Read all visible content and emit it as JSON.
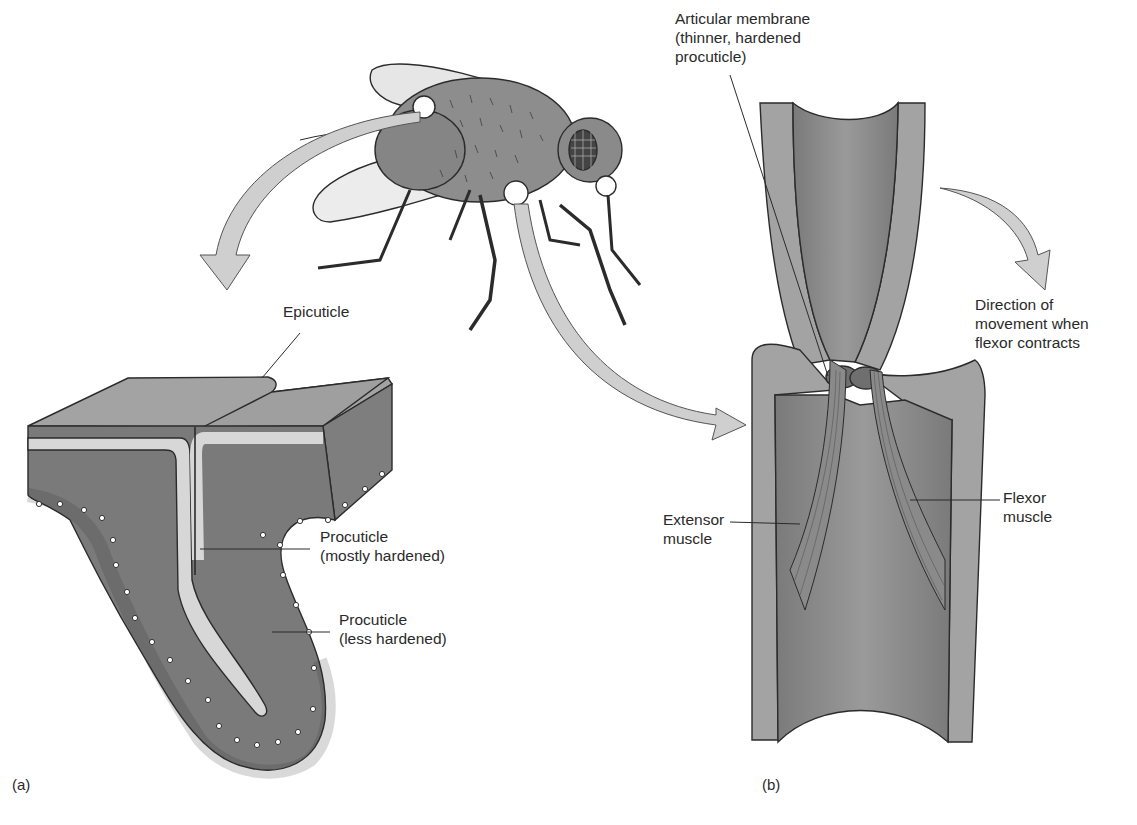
{
  "figure": {
    "panels": [
      {
        "id": "a",
        "label": "(a)",
        "subject": "cuticle-cross-section"
      },
      {
        "id": "b",
        "label": "(b)",
        "subject": "insect-leg-joint"
      }
    ],
    "labels": {
      "epicuticle": "Epicuticle",
      "procuticle_mostly_line1": "Procuticle",
      "procuticle_mostly_line2": "(mostly hardened)",
      "procuticle_less_line1": "Procuticle",
      "procuticle_less_line2": "(less hardened)",
      "articular_line1": "Articular membrane",
      "articular_line2": "(thinner, hardened",
      "articular_line3": "procuticle)",
      "direction_line1": "Direction of",
      "direction_line2": "movement when",
      "direction_line3": "flexor contracts",
      "extensor_line1": "Extensor",
      "extensor_line2": "muscle",
      "flexor_line1": "Flexor",
      "flexor_line2": "muscle"
    },
    "colors": {
      "tissue_dark": "#7d7d7d",
      "tissue_mid": "#9a9a9a",
      "tissue_light": "#c9c9c9",
      "arrow_fill": "#cfcfcf",
      "outline": "#2b2b2b"
    }
  }
}
